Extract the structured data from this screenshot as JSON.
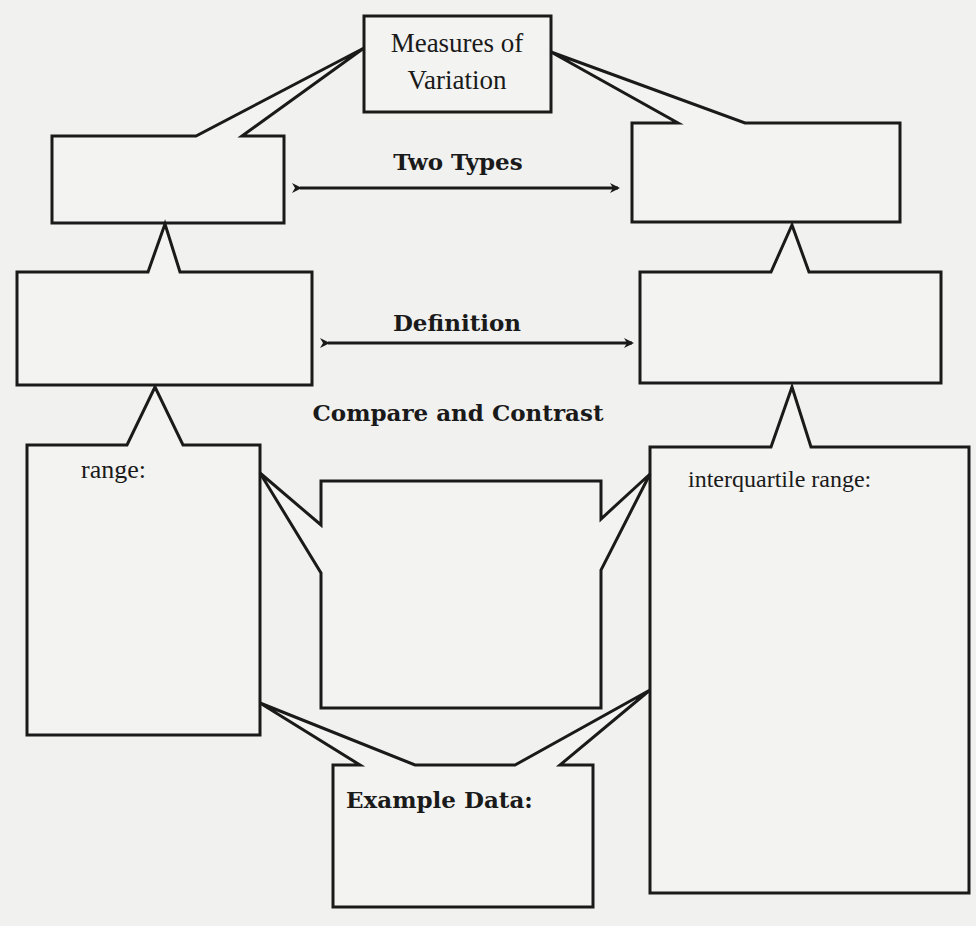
{
  "diagram": {
    "root": {
      "line1": "Measures of",
      "line2": "Variation"
    },
    "connectors": {
      "two_types": "Two Types",
      "definition": "Definition",
      "compare_contrast": "Compare and Contrast"
    },
    "boxes": {
      "type_left": "",
      "type_right": "",
      "definition_left": "",
      "definition_right": "",
      "range_label": "range:",
      "iqr_label": "interquartile range:",
      "compare_box": "",
      "example_label": "Example Data:"
    },
    "colors": {
      "stroke": "#1a1a1a",
      "paper": "#f1f1ef"
    }
  }
}
